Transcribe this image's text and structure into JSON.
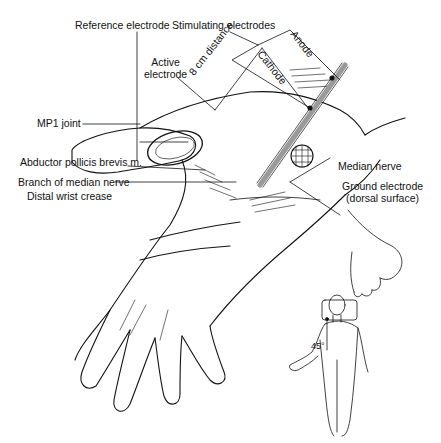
{
  "labels": {
    "reference_electrode": "Reference electrode",
    "stimulating_electrodes": "Stimulating electrodes",
    "active_electrode_l1": "Active",
    "active_electrode_l2": "electrode",
    "distance": "8 cm distance",
    "cathode": "Cathode",
    "anode": "Anode",
    "mp1_joint": "MP1 joint",
    "abductor": "Abductor pollicis brevis m.",
    "branch_median": "Branch of median nerve",
    "distal_wrist_crease": "Distal wrist crease",
    "median_nerve": "Median nerve",
    "ground_electrode_l1": "Ground electrode",
    "ground_electrode_l2": "(dorsal surface)",
    "angle": "45°"
  },
  "colors": {
    "line": "#111111",
    "background": "#ffffff",
    "probe": "#9a9a9a"
  }
}
